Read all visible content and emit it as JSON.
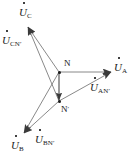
{
  "figure": {
    "type": "phasor-diagram",
    "width": 140,
    "height": 163,
    "background_color": "#ffffff",
    "line_color": "#555555",
    "text_color": "#1a1a1a"
  },
  "nodes": [
    {
      "id": "N",
      "label": "N",
      "prime": "",
      "x": 59,
      "y": 72,
      "label_x": 64,
      "label_y": 59
    },
    {
      "id": "Nprime",
      "label": "N",
      "prime": "′",
      "x": 59,
      "y": 101,
      "label_x": 61,
      "label_y": 106
    }
  ],
  "phasors": [
    {
      "name": "U_C",
      "symbol": "U",
      "subscript": "C",
      "from": "N",
      "tip_x": 28,
      "tip_y": 27,
      "label_x": 19,
      "label_y": 8
    },
    {
      "name": "U_A",
      "symbol": "U",
      "subscript": "A",
      "from": "N",
      "tip_x": 111,
      "tip_y": 72,
      "label_x": 114,
      "label_y": 63
    },
    {
      "name": "U_B",
      "symbol": "U",
      "subscript": "B",
      "from": "N",
      "tip_x": 24,
      "tip_y": 133,
      "label_x": 12,
      "label_y": 141
    }
  ],
  "phasors_from_neutral_prime": [
    {
      "name": "U_CN'",
      "symbol": "U",
      "subscript": "CN",
      "prime": "′",
      "from": "Nprime",
      "tip_x": 28,
      "tip_y": 27,
      "label_x": 2,
      "label_y": 36
    },
    {
      "name": "U_AN'",
      "symbol": "U",
      "subscript": "AN",
      "prime": "′",
      "from": "Nprime",
      "tip_x": 111,
      "tip_y": 72,
      "label_x": 92,
      "label_y": 83
    },
    {
      "name": "U_BN'",
      "symbol": "U",
      "subscript": "BN",
      "prime": "′",
      "from": "Nprime",
      "tip_x": 24,
      "tip_y": 133,
      "label_x": 35,
      "label_y": 135
    }
  ],
  "displacement_phasor": {
    "name": "U_NN'",
    "from": "N",
    "to": "Nprime",
    "description": "neutral displacement arrow from N down to N prime"
  },
  "labels": {
    "node_n": "N",
    "node_n_prime": "N",
    "prime_mark": "′",
    "u_c": "U",
    "u_c_sub": "C",
    "u_a": "U",
    "u_a_sub": "A",
    "u_b": "U",
    "u_b_sub": "B",
    "u_cn": "U",
    "u_cn_sub": "CN",
    "u_an": "U",
    "u_an_sub": "AN",
    "u_bn": "U",
    "u_bn_sub": "BN"
  }
}
